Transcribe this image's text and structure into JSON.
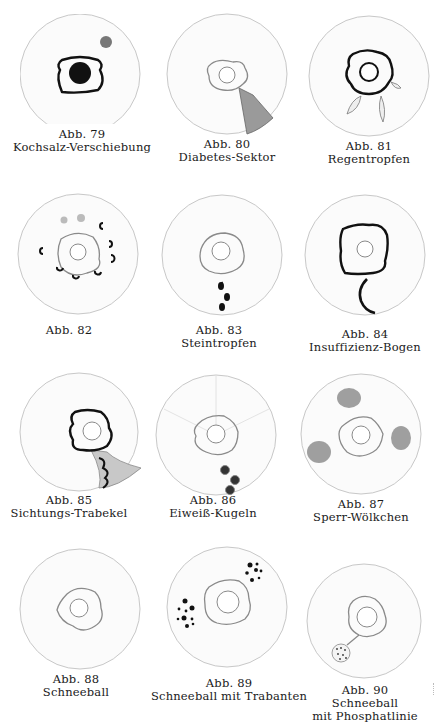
{
  "page": {
    "type": "scanned book plate",
    "background": "#ffffff",
    "figures": [
      {
        "id": "79",
        "label": "Abb. 79",
        "title": "Kochsalz-Verschiebung",
        "sign": "black pupil with bold wreath and dark fleck at upper right"
      },
      {
        "id": "80",
        "label": "Abb. 80",
        "title": "Diabetes-Sektor",
        "sign": "shaded sector from wreath to lower-right rim"
      },
      {
        "id": "81",
        "label": "Abb. 81",
        "title": "Regentropfen",
        "sign": "drop-shaped marks at lower wreath"
      },
      {
        "id": "82",
        "label": "Abb. 82",
        "title": "",
        "sign": "ring of small crescent marks around wreath"
      },
      {
        "id": "83",
        "label": "Abb. 83",
        "title": "Steintropfen",
        "sign": "three black drops below wreath"
      },
      {
        "id": "84",
        "label": "Abb. 84",
        "title": "Insuffizienz-Bogen",
        "sign": "bold square wreath with arc below"
      },
      {
        "id": "85",
        "label": "Abb. 85",
        "title": "Sichtungs-Trabekel",
        "sign": "bold wreath with shaded lobed area below"
      },
      {
        "id": "86",
        "label": "Abb. 86",
        "title": "Eiweiß-Kugeln",
        "sign": "three small spheres below-right of wreath"
      },
      {
        "id": "87",
        "label": "Abb. 87",
        "title": "Sperr-Wölkchen",
        "sign": "three grey cloud patches around wreath"
      },
      {
        "id": "88",
        "label": "Abb. 88",
        "title": "Schneeball",
        "sign": "plain wreath"
      },
      {
        "id": "89",
        "label": "Abb. 89",
        "title": "Schneeball mit Trabanten",
        "sign": "wreath with two dot clusters"
      },
      {
        "id": "90",
        "label": "Abb. 90",
        "title": "Schneeball",
        "title2": "mit Phosphatlinie",
        "sign": "wreath with line to dotted ball at lower-left"
      }
    ]
  }
}
